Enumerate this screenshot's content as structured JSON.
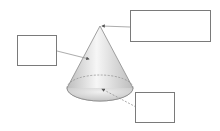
{
  "diagram": {
    "colors": {
      "outline": "#8a8a8a",
      "box_border": "#7a7a7a",
      "arrow": "#666666",
      "shade_dark": "#b8b8b8",
      "shade_light": "#f4f4f4"
    },
    "label_boxes": [
      {
        "id": "apex",
        "text": "",
        "points_to": "apex (vertex)"
      },
      {
        "id": "lateral-surface",
        "text": "",
        "points_to": "curved surface"
      },
      {
        "id": "base",
        "text": "",
        "points_to": "base center"
      }
    ]
  }
}
